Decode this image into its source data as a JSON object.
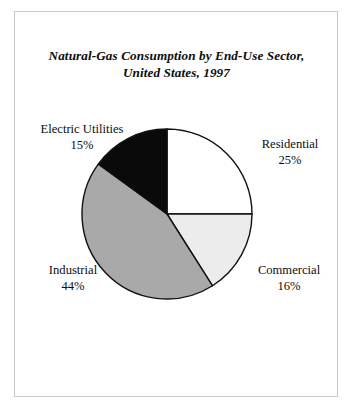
{
  "figure": {
    "border_color": "#c9c9c9",
    "background": "#ffffff"
  },
  "title": {
    "line1": "Natural-Gas Consumption by End-Use Sector,",
    "line2": "United States, 1997"
  },
  "labels": {
    "electric_utilities": {
      "name": "Electric Utilities",
      "value": "15%"
    },
    "residential": {
      "name": "Residential",
      "value": "25%"
    },
    "commercial": {
      "name": "Commercial",
      "value": "16%"
    },
    "industrial": {
      "name": "Industrial",
      "value": "44%"
    }
  },
  "chart_data": {
    "type": "pie",
    "title": "Natural-Gas Consumption by End-Use Sector, United States, 1997",
    "xlabel": "",
    "ylabel": "",
    "units": "percent",
    "start_angle_deg": 0,
    "direction": "clockwise",
    "center": {
      "x": 167,
      "y": 214
    },
    "radius": 85,
    "grid": false,
    "legend": "none",
    "labels_placement": "outside-callout",
    "categories": [
      "Residential",
      "Commercial",
      "Industrial",
      "Electric Utilities"
    ],
    "values": [
      25,
      16,
      44,
      15
    ],
    "slice_colors": [
      "#ffffff",
      "#ececec",
      "#a9a9a9",
      "#0a0a0a"
    ],
    "slice_edge_color": "#111111",
    "slices": [
      {
        "label": "Residential",
        "value": 25,
        "color": "#ffffff",
        "start_deg": 0,
        "end_deg": 90
      },
      {
        "label": "Commercial",
        "value": 16,
        "color": "#ececec",
        "start_deg": 90,
        "end_deg": 147.6
      },
      {
        "label": "Industrial",
        "value": 44,
        "color": "#a9a9a9",
        "start_deg": 147.6,
        "end_deg": 306
      },
      {
        "label": "Electric Utilities",
        "value": 15,
        "color": "#0a0a0a",
        "start_deg": 306,
        "end_deg": 360
      }
    ],
    "annotations": [
      "Electric Utilities 15%",
      "Residential 25%",
      "Commercial 16%",
      "Industrial 44%"
    ]
  }
}
